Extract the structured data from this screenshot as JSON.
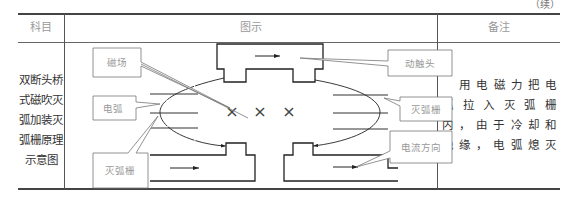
{
  "continued_mark": "（续）",
  "table": {
    "headers": {
      "subject": "科目",
      "figure": "图示",
      "note": "备注"
    },
    "row": {
      "subject_lines": [
        "双断头桥",
        "式磁吹灭",
        "弧加装灭",
        "弧栅原理",
        "示意图"
      ],
      "note_lines": [
        "用电磁力把电",
        "弧拉入灭弧栅",
        "内，由于冷却和",
        "绝缘，电弧熄灭"
      ]
    }
  },
  "diagram": {
    "labels": {
      "magnetic_field": "磁场",
      "arc": "电弧",
      "arc_chute_left": "灭弧栅",
      "moving_contact": "动触头",
      "arc_chute_right": "灭弧栅",
      "current_direction": "电流方向"
    },
    "field_symbols": [
      "×",
      "×",
      "×"
    ]
  }
}
